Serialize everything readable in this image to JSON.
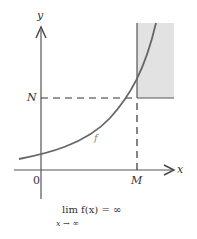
{
  "diagram": {
    "axes": {
      "x_label": "x",
      "y_label": "y",
      "origin_label": "0"
    },
    "markers": {
      "N_label": "N",
      "M_label": "M"
    },
    "curve_label": "f",
    "caption": {
      "main": "lim f(x) = ∞",
      "subscript": "x → ∞"
    },
    "colors": {
      "curve": "#555555",
      "axes": "#444444",
      "shaded_region": "#e2e2e2",
      "dashed": "#333333"
    }
  }
}
